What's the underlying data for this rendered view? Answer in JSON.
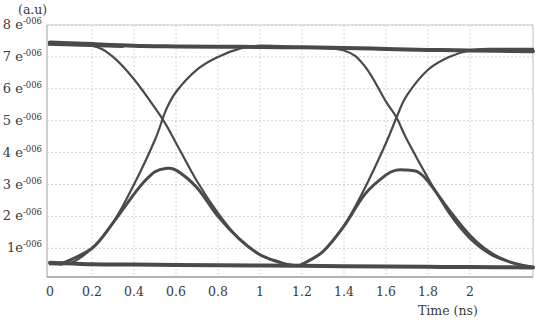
{
  "chart_data": {
    "type": "line",
    "title": "",
    "subtitle": "Eye diagram",
    "ylabel": "(a.u)",
    "xlabel": "Time (ns)",
    "x_ticks": [
      "0",
      "0.2",
      "0.4",
      "0.6",
      "0.8",
      "1",
      "1.2",
      "1.4",
      "1.6",
      "1.8",
      "2"
    ],
    "y_ticks": [
      {
        "mant": "1",
        "exp": "-006",
        "value": 1e-06
      },
      {
        "mant": "2",
        "exp": "-006",
        "value": 2e-06
      },
      {
        "mant": "3",
        "exp": "-006",
        "value": 3e-06
      },
      {
        "mant": "4",
        "exp": "-006",
        "value": 4e-06
      },
      {
        "mant": "5",
        "exp": "-006",
        "value": 5e-06
      },
      {
        "mant": "6",
        "exp": "-006",
        "value": 6e-06
      },
      {
        "mant": "7",
        "exp": "-006",
        "value": 7e-06
      },
      {
        "mant": "8",
        "exp": "-006",
        "value": 8e-06
      }
    ],
    "xlim": [
      0,
      2.3
    ],
    "ylim": [
      0,
      8e-06
    ],
    "grid": true,
    "legend": null,
    "line_color": "#4a4a4a",
    "series": [
      {
        "name": "high-level",
        "x": [
          0,
          0.2,
          0.4,
          0.6,
          0.8,
          1.0,
          1.2,
          1.4,
          1.6,
          1.8,
          2.0,
          2.3
        ],
        "y": [
          7.45e-06,
          7.4e-06,
          7.35e-06,
          7.33e-06,
          7.32e-06,
          7.31e-06,
          7.3e-06,
          7.28e-06,
          7.25e-06,
          7.22e-06,
          7.2e-06,
          7.18e-06
        ]
      },
      {
        "name": "low-level",
        "x": [
          0,
          0.2,
          0.4,
          0.6,
          0.8,
          1.0,
          1.2,
          1.4,
          1.6,
          1.8,
          2.0,
          2.3
        ],
        "y": [
          5.5e-07,
          5e-07,
          4.9e-07,
          4.8e-07,
          4.7e-07,
          4.6e-07,
          4.5e-07,
          4.4e-07,
          4.3e-07,
          4.2e-07,
          4.1e-07,
          4e-07
        ]
      },
      {
        "name": "falling-1",
        "x": [
          0,
          0.2,
          0.3,
          0.4,
          0.5,
          0.55,
          0.6,
          0.7,
          0.8,
          0.9,
          1.0,
          1.1,
          1.2
        ],
        "y": [
          7.45e-06,
          7.35e-06,
          7e-06,
          6.3e-06,
          5.4e-06,
          4.9e-06,
          4.3e-06,
          3.1e-06,
          2.1e-06,
          1.3e-06,
          8e-07,
          5.5e-07,
          4.5e-07
        ]
      },
      {
        "name": "rising-1",
        "x": [
          0,
          0.1,
          0.2,
          0.3,
          0.4,
          0.5,
          0.55,
          0.6,
          0.7,
          0.8,
          0.9,
          1.0,
          1.2
        ],
        "y": [
          5e-07,
          5.5e-07,
          1e-06,
          1.8e-06,
          3e-06,
          4.4e-06,
          5.3e-06,
          5.9e-06,
          6.6e-06,
          7e-06,
          7.25e-06,
          7.35e-06,
          7.3e-06
        ]
      },
      {
        "name": "isolated-pulse-1",
        "x": [
          0.05,
          0.2,
          0.3,
          0.4,
          0.45,
          0.5,
          0.55,
          0.6,
          0.7,
          0.8,
          0.9,
          1.0,
          1.1,
          1.15
        ],
        "y": [
          5e-07,
          1e-06,
          1.8e-06,
          2.7e-06,
          3.1e-06,
          3.4e-06,
          3.5e-06,
          3.45e-06,
          2.9e-06,
          2e-06,
          1.3e-06,
          8e-07,
          5.5e-07,
          4.5e-07
        ]
      },
      {
        "name": "falling-2",
        "x": [
          1.2,
          1.4,
          1.5,
          1.6,
          1.65,
          1.7,
          1.8,
          1.9,
          2.0,
          2.1,
          2.2,
          2.3
        ],
        "y": [
          7.3e-06,
          7.2e-06,
          6.7e-06,
          5.6e-06,
          5.1e-06,
          4.4e-06,
          3.2e-06,
          2.1e-06,
          1.3e-06,
          8e-07,
          5.5e-07,
          4e-07
        ]
      },
      {
        "name": "rising-2",
        "x": [
          1.15,
          1.2,
          1.3,
          1.4,
          1.5,
          1.6,
          1.65,
          1.7,
          1.8,
          1.9,
          2.0,
          2.1,
          2.3
        ],
        "y": [
          4.5e-07,
          5e-07,
          9e-07,
          1.7e-06,
          2.9e-06,
          4.3e-06,
          5.1e-06,
          5.8e-06,
          6.6e-06,
          7e-06,
          7.2e-06,
          7.25e-06,
          7.25e-06
        ]
      },
      {
        "name": "isolated-pulse-2",
        "x": [
          1.2,
          1.3,
          1.4,
          1.5,
          1.6,
          1.65,
          1.7,
          1.75,
          1.8,
          1.9,
          2.0,
          2.1,
          2.2,
          2.3
        ],
        "y": [
          5e-07,
          9e-07,
          1.7e-06,
          2.7e-06,
          3.3e-06,
          3.45e-06,
          3.45e-06,
          3.4e-06,
          3.1e-06,
          2.2e-06,
          1.4e-06,
          8.5e-07,
          5.5e-07,
          4e-07
        ]
      }
    ]
  }
}
